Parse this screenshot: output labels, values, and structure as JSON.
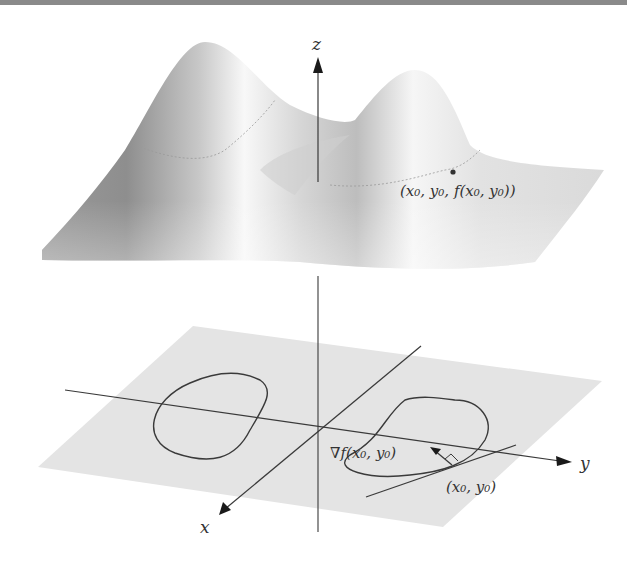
{
  "figure": {
    "axes": {
      "z_label": "z",
      "x_label": "x",
      "y_label": "y"
    },
    "annotations": {
      "surface_point": "(x₀, y₀, f(x₀, y₀))",
      "gradient": "∇f(x₀, y₀)",
      "plane_point": "(x₀, y₀)"
    },
    "colors": {
      "plane_fill": "#e4e4e4",
      "surface_dark": "#8c8c8c",
      "surface_light": "#f6f6f6",
      "line": "#3a3a3a",
      "top_rule": "#8a8a8a"
    }
  }
}
